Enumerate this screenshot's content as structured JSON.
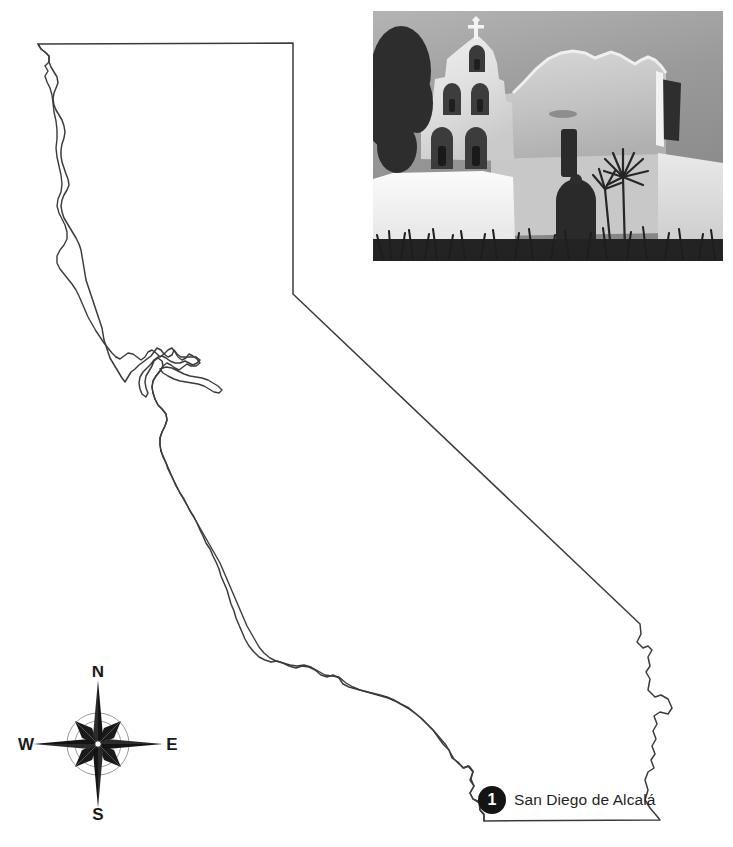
{
  "page": {
    "background_color": "#ffffff",
    "width": 733,
    "height": 847
  },
  "map": {
    "name": "california-state-outline",
    "region": "California",
    "outline_color": "#3b3b3b",
    "fill_color": "#ffffff",
    "stroke_width": 1.5
  },
  "photo": {
    "name": "mission-photograph",
    "caption": "",
    "subject": "Mission San Diego de Alcala facade",
    "style": "black-and-white photograph",
    "elements": [
      "campanario bell wall",
      "cross at apex",
      "five bell openings",
      "arched wooden door",
      "tree at left",
      "yucca plants",
      "white adobe walls"
    ]
  },
  "markers": [
    {
      "number": "1",
      "label": "San Diego de Alcalá",
      "badge_color": "#141414",
      "badge_text_color": "#ffffff"
    }
  ],
  "compass": {
    "name": "compass-rose",
    "north": "N",
    "south": "S",
    "east": "E",
    "west": "W",
    "color": "#1a1a1a"
  }
}
